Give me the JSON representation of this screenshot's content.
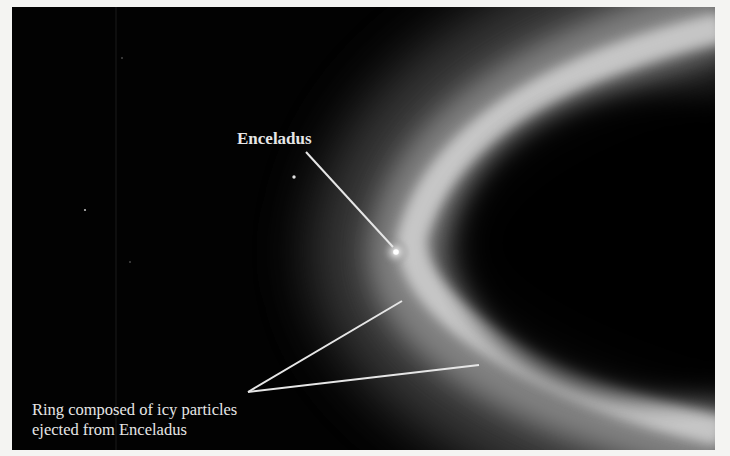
{
  "figure": {
    "annotations": {
      "moon_label": "Enceladus",
      "ring_caption_lines": [
        "Ring composed of icy particles",
        "ejected from Enceladus"
      ]
    },
    "colors": {
      "background": "#020202",
      "ring_glow": "#d8d8d8",
      "annotation": "#e6e6e6",
      "page_border": "#f4f4f2"
    }
  }
}
